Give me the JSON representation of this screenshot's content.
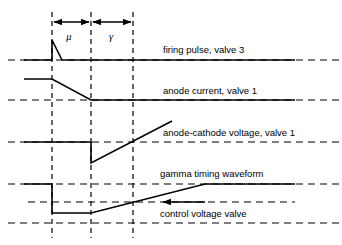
{
  "figure": {
    "background_color": "#ffffff",
    "line_color": "#000000",
    "width": 342,
    "height": 245
  },
  "dimensions": {
    "mu_label": "μ",
    "gamma_label": "γ",
    "mu_span_x": [
      52,
      91
    ],
    "gamma_span_x": [
      91,
      133
    ],
    "arrow_y": 22
  },
  "timing_markers": {
    "label": "vertical timing reference lines",
    "x_positions": [
      52,
      91,
      133
    ],
    "style": "dashed",
    "y_top": 12,
    "y_bottom": 238
  },
  "traces": [
    {
      "id": "firing-pulse-valve-3",
      "label": "firing pulse, valve 3",
      "label_x": 163,
      "label_y": 53,
      "baseline_y": 60,
      "baseline_dashed_x": [
        8,
        342
      ],
      "points": [
        [
          24,
          60
        ],
        [
          52,
          60
        ],
        [
          52,
          40
        ],
        [
          62,
          60
        ],
        [
          295,
          60
        ]
      ]
    },
    {
      "id": "anode-current-valve-1",
      "label": "anode current, valve 1",
      "label_x": 163,
      "label_y": 94,
      "baseline_y": 100,
      "baseline_dashed_x": [
        8,
        342
      ],
      "points": [
        [
          24,
          79
        ],
        [
          52,
          79
        ],
        [
          91,
          100
        ],
        [
          295,
          100
        ]
      ]
    },
    {
      "id": "anode-cathode-voltage-valve-1",
      "label": "anode-cathode voltage, valve 1",
      "label_x": 163,
      "label_y": 136,
      "baseline_y": 142,
      "baseline_dashed_x": [
        8,
        342
      ],
      "points": [
        [
          24,
          142
        ],
        [
          91,
          142
        ],
        [
          91,
          163
        ],
        [
          172,
          121
        ]
      ]
    },
    {
      "id": "gamma-timing-waveform",
      "label": "gamma timing waveform",
      "label_x": 160,
      "label_y": 177,
      "baseline_y": 184,
      "baseline_dashed_x": [
        8,
        342
      ],
      "points": [
        [
          24,
          184
        ],
        [
          52,
          184
        ],
        [
          52,
          213
        ],
        [
          91,
          213
        ],
        [
          205,
          184
        ],
        [
          295,
          184
        ]
      ]
    },
    {
      "id": "control-voltage-valve",
      "label": "control voltage valve",
      "label_x": 160,
      "label_y": 217,
      "baseline_y": 223,
      "baseline_dashed_x": [
        8,
        342
      ],
      "mid_reference_y": 202,
      "mid_reference_x": [
        28,
        295
      ]
    }
  ],
  "callout_arrow": {
    "id": "control-voltage-callout",
    "label": "points to control voltage valve ramp",
    "tail_x": 205,
    "tip_x": 161,
    "y": 202
  }
}
